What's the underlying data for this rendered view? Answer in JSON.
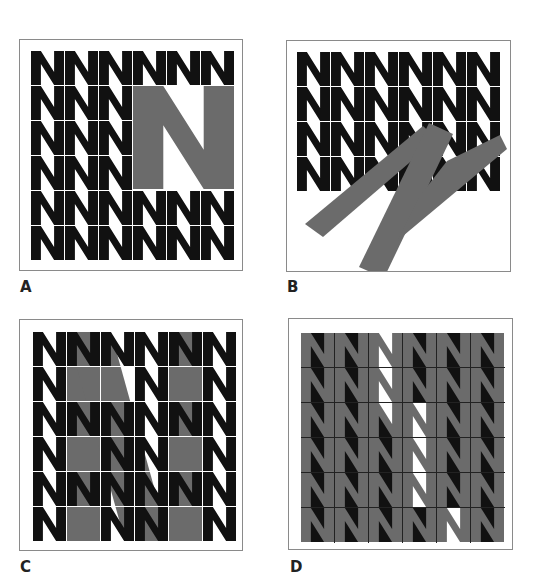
{
  "figure": {
    "colors": {
      "black": "#111111",
      "gray": "#6b6b6b",
      "white": "#ffffff",
      "frame": "#8a8a8a"
    },
    "panels": [
      {
        "id": "A",
        "label": "A",
        "frame": {
          "x": 19,
          "y": 39,
          "w": 224,
          "h": 232
        },
        "label_pos": {
          "x": 20,
          "y": 280
        },
        "grid": {
          "x": 11,
          "y": 11,
          "cols": 6,
          "rows": 6,
          "cw": 34,
          "ch": 35,
          "gap": 1
        },
        "description": "6x6 grid of black N letters with a large gray N replacing a 3x4 block (cols 4-6, rows 2-5)",
        "big_n": {
          "x": 113,
          "y": 46,
          "w": 101,
          "h": 103,
          "color": "gray",
          "rotate": 0
        },
        "hidden_cells": [
          [
            1,
            3
          ],
          [
            1,
            4
          ],
          [
            1,
            5
          ],
          [
            2,
            3
          ],
          [
            2,
            4
          ],
          [
            2,
            5
          ],
          [
            3,
            3
          ],
          [
            3,
            4
          ],
          [
            3,
            5
          ]
        ]
      },
      {
        "id": "B",
        "label": "B",
        "frame": {
          "x": 286,
          "y": 40,
          "w": 225,
          "h": 232
        },
        "label_pos": {
          "x": 287,
          "y": 280
        },
        "grid": {
          "x": 10,
          "y": 11,
          "cols": 6,
          "rows": 4,
          "cw": 34,
          "ch": 35,
          "gap": 1
        },
        "description": "6x4 grid of black N letters with a large rotated gray N overlapping the lower part",
        "big_n": {
          "rotated": true,
          "color": "gray"
        }
      },
      {
        "id": "C",
        "label": "C",
        "frame": {
          "x": 19,
          "y": 319,
          "w": 224,
          "h": 232
        },
        "label_pos": {
          "x": 20,
          "y": 560
        },
        "grid": {
          "x": 13,
          "y": 12,
          "cols": 6,
          "rows": 6,
          "cw": 34,
          "ch": 35,
          "gap": 1
        },
        "description": "6x6 grid of black N letters; a large gray N spans cols 2-5 behind, some N letters removed revealing it",
        "big_n": {
          "x": 47,
          "y": 12,
          "w": 137,
          "h": 208,
          "color": "gray"
        },
        "hidden_cells": [
          [
            1,
            1
          ],
          [
            1,
            2
          ],
          [
            1,
            4
          ],
          [
            3,
            1
          ],
          [
            3,
            4
          ],
          [
            5,
            1
          ],
          [
            5,
            4
          ]
        ]
      },
      {
        "id": "D",
        "label": "D",
        "frame": {
          "x": 288,
          "y": 318,
          "w": 225,
          "h": 232
        },
        "label_pos": {
          "x": 290,
          "y": 560
        },
        "grid": {
          "x": 12,
          "y": 14,
          "cols": 6,
          "rows": 6,
          "cw": 34,
          "ch": 35,
          "gap": 1
        },
        "description": "6x6 grid of gray N letters; counters filled black except inside a large N-shaped region where they are white"
      }
    ]
  }
}
